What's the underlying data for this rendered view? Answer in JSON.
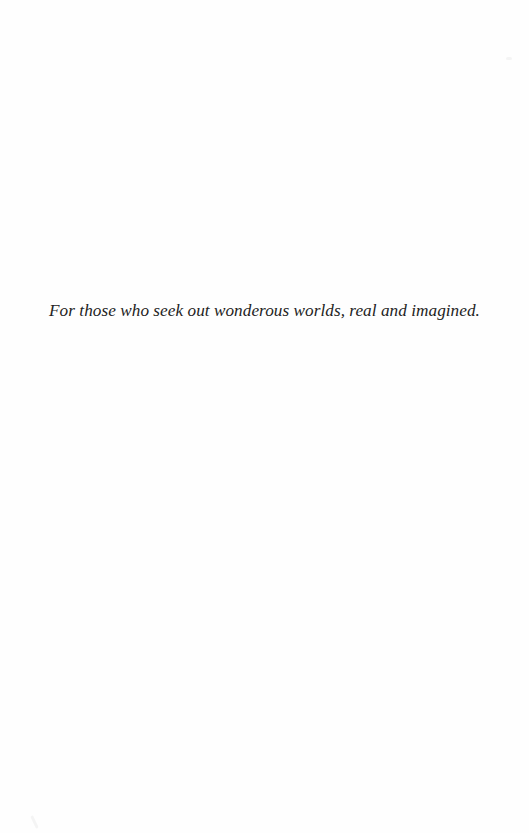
{
  "page": {
    "type": "dedication",
    "background_color": "#fefefe",
    "text_color": "#232323"
  },
  "dedication": {
    "text": "For those who seek out wonderous worlds, real and imagined."
  }
}
